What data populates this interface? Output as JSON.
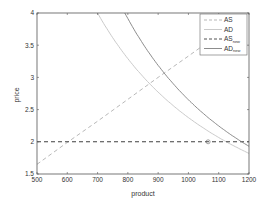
{
  "chart_data": {
    "type": "line",
    "title": "",
    "xlabel": "product",
    "ylabel": "price",
    "xlim": [
      500,
      1200
    ],
    "ylim": [
      1.5,
      4
    ],
    "xticks": [
      500,
      600,
      700,
      800,
      900,
      1000,
      1100,
      1200
    ],
    "yticks": [
      1.5,
      2,
      2.5,
      3,
      3.5,
      4
    ],
    "ytick_labels": [
      "1.5",
      "2",
      "2.5",
      "3",
      "3.5",
      "4"
    ],
    "grid": false,
    "legend_position": "upper right",
    "series": [
      {
        "name": "AS",
        "style": "dashed",
        "color": "#b0b0b0",
        "x": [
          500,
          600,
          700,
          800,
          900,
          1000,
          1100,
          1200
        ],
        "y": [
          1.65,
          1.99,
          2.32,
          2.66,
          3.0,
          3.33,
          3.67,
          4.0
        ]
      },
      {
        "name": "AD",
        "style": "solid",
        "color": "#c4c4c4",
        "x": [
          700,
          800,
          900,
          1000,
          1100,
          1200
        ],
        "y": [
          4.0,
          3.28,
          2.77,
          2.38,
          2.07,
          1.82
        ]
      },
      {
        "name": "AS_new",
        "style": "dashed",
        "color": "#404040",
        "x": [
          500,
          1200
        ],
        "y": [
          2.0,
          2.0
        ]
      },
      {
        "name": "AD_new",
        "style": "solid",
        "color": "#808080",
        "x": [
          790,
          900,
          1000,
          1100,
          1200
        ],
        "y": [
          4.0,
          3.18,
          2.67,
          2.28,
          1.93
        ]
      }
    ],
    "annotations": [
      {
        "type": "circle-marker",
        "x": 1065,
        "y": 2.0
      }
    ]
  },
  "legend": {
    "items": [
      {
        "label": "AS",
        "sub": ""
      },
      {
        "label": "AD",
        "sub": ""
      },
      {
        "label": "AS",
        "sub": "new"
      },
      {
        "label": "AD",
        "sub": "new"
      }
    ]
  }
}
